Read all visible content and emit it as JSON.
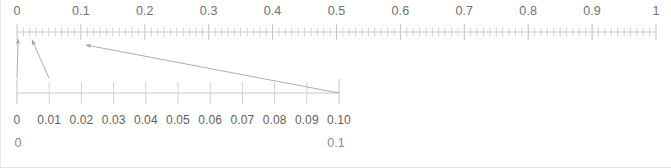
{
  "figure": {
    "width": 671,
    "height": 168,
    "background_color": "#ffffff",
    "axis_color": "#c9c9c9",
    "tick_color": "#d2d2d2",
    "arrow_color": "#9e9e9e",
    "label_color": "#6d6d6d"
  },
  "chart_data": {
    "type": "line",
    "xlabel": "",
    "ylabel": "",
    "grid": false,
    "legend": null,
    "axes": [
      {
        "name": "top-scale",
        "range": [
          0,
          1
        ],
        "pixel_range": [
          16,
          655
        ],
        "y_pixel": 32,
        "major_tick_step": 0.1,
        "minor_tick_step": 0.01,
        "major_ticks": [
          0,
          0.1,
          0.2,
          0.3,
          0.4,
          0.5,
          0.6,
          0.7,
          0.8,
          0.9,
          1
        ],
        "tick_labels": [
          "0",
          "0.1",
          "0.2",
          "0.3",
          "0.4",
          "0.5",
          "0.6",
          "0.7",
          "0.8",
          "0.9",
          "1"
        ]
      },
      {
        "name": "zoom-scale",
        "range": [
          0,
          0.1
        ],
        "pixel_range": [
          16,
          338
        ],
        "y_pixel": 93,
        "major_tick_step": 0.01,
        "major_ticks": [
          0,
          0.01,
          0.02,
          0.03,
          0.04,
          0.05,
          0.06,
          0.07,
          0.08,
          0.09,
          0.1
        ],
        "tick_labels": [
          "0",
          "0.01",
          "0.02",
          "0.03",
          "0.04",
          "0.05",
          "0.06",
          "0.07",
          "0.08",
          "0.09",
          "0.10"
        ]
      }
    ],
    "annotations": [
      {
        "name": "zoom-connector-left",
        "kind": "arrow",
        "from_value": 0,
        "from_axis": "zoom-scale",
        "to_value": 0,
        "to_axis": "top-scale",
        "from_pixel": [
          16,
          78
        ],
        "to_pixel": [
          17,
          39
        ]
      },
      {
        "name": "zoom-connector-mid",
        "kind": "arrow",
        "from_value": 0.01,
        "from_axis": "zoom-scale",
        "to_value": 0,
        "to_axis": "top-scale",
        "from_pixel": [
          48,
          78
        ],
        "to_pixel": [
          31,
          40
        ]
      },
      {
        "name": "zoom-connector-right",
        "kind": "arrow",
        "from_value": 0.1,
        "from_axis": "zoom-scale",
        "to_value": 0.1,
        "to_axis": "top-scale",
        "from_pixel": [
          338,
          93
        ],
        "to_pixel": [
          85,
          45
        ]
      }
    ],
    "footer_labels": [
      {
        "text": "0",
        "value": 0,
        "pixel_x": 17
      },
      {
        "text": "0.1",
        "value": 0.1,
        "pixel_x": 335
      }
    ]
  },
  "top_scale": {
    "name": "top-scale",
    "labels": [
      "0",
      "0.1",
      "0.2",
      "0.3",
      "0.4",
      "0.5",
      "0.6",
      "0.7",
      "0.8",
      "0.9",
      "1"
    ],
    "values": [
      0,
      0.1,
      0.2,
      0.3,
      0.4,
      0.5,
      0.6,
      0.7,
      0.8,
      0.9,
      1
    ]
  },
  "zoom_scale": {
    "name": "zoom-scale",
    "labels": [
      "0",
      "0.01",
      "0.02",
      "0.03",
      "0.04",
      "0.05",
      "0.06",
      "0.07",
      "0.08",
      "0.09",
      "0.10"
    ],
    "values": [
      0,
      0.01,
      0.02,
      0.03,
      0.04,
      0.05,
      0.06,
      0.07,
      0.08,
      0.09,
      0.1
    ]
  },
  "footer": {
    "left_label": "0",
    "right_label": "0.1"
  }
}
